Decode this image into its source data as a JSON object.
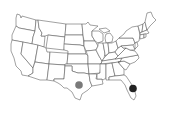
{
  "map": {
    "type": "us-states-outline",
    "background": "#ffffff",
    "stroke_color": "#555555",
    "fill_color": "#ffffff"
  },
  "markers": [
    {
      "name": "texas-marker",
      "state": "Texas",
      "cx": 79,
      "cy": 85,
      "r": 3.8,
      "color": "#7a7a7a"
    },
    {
      "name": "florida-marker",
      "state": "Florida",
      "cx": 133,
      "cy": 88.5,
      "r": 3.8,
      "color": "#222222"
    }
  ]
}
